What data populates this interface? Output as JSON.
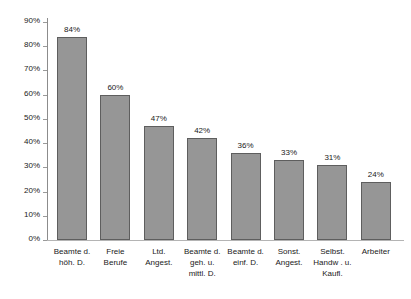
{
  "chart_data": {
    "type": "bar",
    "title": "",
    "xlabel": "",
    "ylabel": "",
    "ylim": [
      0,
      90
    ],
    "grid": false,
    "legend": false,
    "y_ticks": [
      "0%",
      "10%",
      "20%",
      "30%",
      "40%",
      "50%",
      "60%",
      "70%",
      "80%",
      "90%"
    ],
    "y_tick_values": [
      0,
      10,
      20,
      30,
      40,
      50,
      60,
      70,
      80,
      90
    ],
    "categories": [
      "Beamte d. höh. D.",
      "Freie Berufe",
      "Ltd. Angest.",
      "Beamte d. geh. u. mittl. D.",
      "Beamte d. einf. D.",
      "Sonst. Angest.",
      "Selbst. Handw . u. Kaufl.",
      "Arbeiter"
    ],
    "category_lines": [
      [
        "Beamte d.",
        "höh. D."
      ],
      [
        "Freie",
        "Berufe"
      ],
      [
        "Ltd.",
        "Angest."
      ],
      [
        "Beamte d.",
        "geh. u.",
        "mittl. D."
      ],
      [
        "Beamte d.",
        "einf. D."
      ],
      [
        "Sonst.",
        "Angest."
      ],
      [
        "Selbst.",
        "Handw . u.",
        "Kaufl."
      ],
      [
        "Arbeiter"
      ]
    ],
    "values": [
      84,
      60,
      47,
      42,
      36,
      33,
      31,
      24
    ],
    "data_labels": [
      "84%",
      "60%",
      "47%",
      "42%",
      "36%",
      "33%",
      "31%",
      "24%"
    ],
    "colors": {
      "bar_fill": "#969696",
      "bar_border": "#5e5e5e",
      "axis": "#8c8c8c",
      "baseline": "#b4b4b4",
      "text": "#1a1a1a",
      "background": "#ffffff"
    }
  }
}
